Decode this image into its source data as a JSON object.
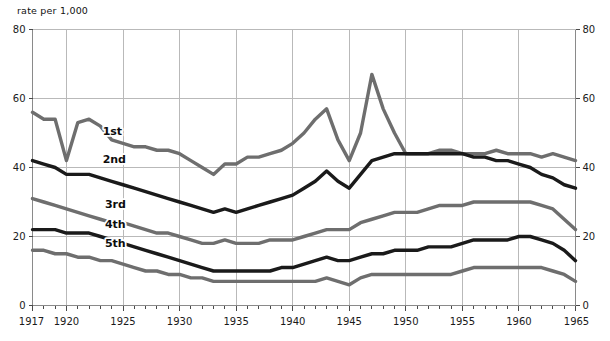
{
  "chart_data": {
    "type": "line",
    "title": "",
    "subtitle": "",
    "ylabel": "rate per 1,000",
    "xlabel": "",
    "xlim": [
      1917,
      1965
    ],
    "ylim": [
      0,
      80
    ],
    "grid": true,
    "legend_position": "inline-on-curves",
    "x_ticks_major": [
      1917,
      1920,
      1925,
      1930,
      1935,
      1940,
      1945,
      1950,
      1955,
      1960,
      1965
    ],
    "x_ticks_minor_step": 1,
    "y_ticks": [
      0,
      20,
      40,
      60,
      80
    ],
    "y_axis_left_labels": [
      "0",
      "20",
      "40",
      "60",
      "80"
    ],
    "y_axis_right_labels": [
      "0",
      "20",
      "40",
      "60",
      "80"
    ],
    "x": [
      1917,
      1918,
      1919,
      1920,
      1921,
      1922,
      1923,
      1924,
      1925,
      1926,
      1927,
      1928,
      1929,
      1930,
      1931,
      1932,
      1933,
      1934,
      1935,
      1936,
      1937,
      1938,
      1939,
      1940,
      1941,
      1942,
      1943,
      1944,
      1945,
      1946,
      1947,
      1948,
      1949,
      1950,
      1951,
      1952,
      1953,
      1954,
      1955,
      1956,
      1957,
      1958,
      1959,
      1960,
      1961,
      1962,
      1963,
      1964,
      1965
    ],
    "series": [
      {
        "name": "1st",
        "label": "1st",
        "color": "#6e6e6e",
        "values": [
          56,
          54,
          54,
          42,
          53,
          54,
          52,
          48,
          47,
          46,
          46,
          45,
          45,
          44,
          42,
          40,
          38,
          41,
          41,
          43,
          43,
          44,
          45,
          47,
          50,
          54,
          57,
          48,
          42,
          50,
          67,
          57,
          50,
          44,
          44,
          44,
          45,
          45,
          44,
          44,
          44,
          45,
          44,
          44,
          44,
          43,
          44,
          43,
          42
        ]
      },
      {
        "name": "2nd",
        "label": "2nd",
        "color": "#1a1a1a",
        "values": [
          42,
          41,
          40,
          38,
          38,
          38,
          37,
          36,
          35,
          34,
          33,
          32,
          31,
          30,
          29,
          28,
          27,
          28,
          27,
          28,
          29,
          30,
          31,
          32,
          34,
          36,
          39,
          36,
          34,
          38,
          42,
          43,
          44,
          44,
          44,
          44,
          44,
          44,
          44,
          43,
          43,
          42,
          42,
          41,
          40,
          38,
          37,
          35,
          34
        ]
      },
      {
        "name": "3rd",
        "label": "3rd",
        "color": "#6e6e6e",
        "values": [
          31,
          30,
          29,
          28,
          27,
          26,
          25,
          24,
          24,
          23,
          22,
          21,
          21,
          20,
          19,
          18,
          18,
          19,
          18,
          18,
          18,
          19,
          19,
          19,
          20,
          21,
          22,
          22,
          22,
          24,
          25,
          26,
          27,
          27,
          27,
          28,
          29,
          29,
          29,
          30,
          30,
          30,
          30,
          30,
          30,
          29,
          28,
          25,
          22
        ]
      },
      {
        "name": "4th",
        "label": "4th",
        "color": "#1a1a1a",
        "values": [
          22,
          22,
          22,
          21,
          21,
          21,
          20,
          19,
          18,
          17,
          16,
          15,
          14,
          13,
          12,
          11,
          10,
          10,
          10,
          10,
          10,
          10,
          11,
          11,
          12,
          13,
          14,
          13,
          13,
          14,
          15,
          15,
          16,
          16,
          16,
          17,
          17,
          17,
          18,
          19,
          19,
          19,
          19,
          20,
          20,
          19,
          18,
          16,
          13
        ]
      },
      {
        "name": "5th",
        "label": "5th",
        "color": "#6e6e6e",
        "values": [
          16,
          16,
          15,
          15,
          14,
          14,
          13,
          13,
          12,
          11,
          10,
          10,
          9,
          9,
          8,
          8,
          7,
          7,
          7,
          7,
          7,
          7,
          7,
          7,
          7,
          7,
          8,
          7,
          6,
          8,
          9,
          9,
          9,
          9,
          9,
          9,
          9,
          9,
          10,
          11,
          11,
          11,
          11,
          11,
          11,
          11,
          10,
          9,
          7
        ]
      }
    ],
    "series_label_positions": [
      {
        "name": "1st",
        "year": 1923.2,
        "value": 49.5
      },
      {
        "name": "2nd",
        "year": 1923.2,
        "value": 41.2
      },
      {
        "name": "3rd",
        "year": 1923.4,
        "value": 28.4
      },
      {
        "name": "4th",
        "year": 1923.4,
        "value": 22.4
      },
      {
        "name": "5th",
        "year": 1923.4,
        "value": 17.0
      }
    ]
  }
}
